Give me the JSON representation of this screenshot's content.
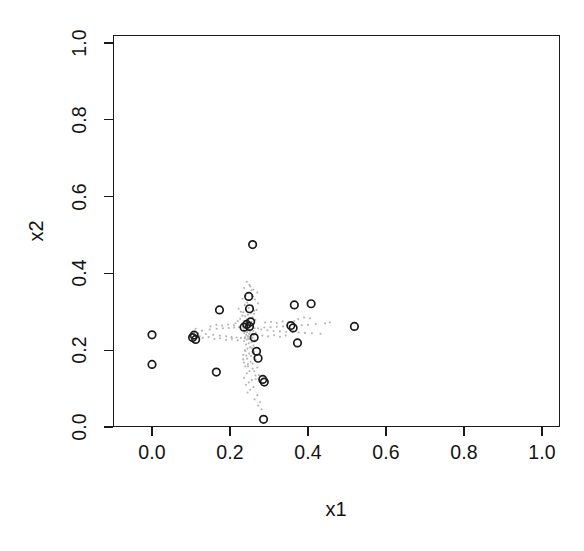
{
  "chart_data": {
    "type": "scatter",
    "title": "",
    "xlabel": "x1",
    "ylabel": "x2",
    "xlim": [
      0,
      1
    ],
    "ylim": [
      0,
      1
    ],
    "xticks": [
      "0.0",
      "0.2",
      "0.4",
      "0.6",
      "0.8",
      "1.0"
    ],
    "xtickvalues": [
      0.0,
      0.2,
      0.4,
      0.6,
      0.8,
      1.0
    ],
    "yticks": [
      "0.0",
      "0.2",
      "0.4",
      "0.6",
      "0.8",
      "1.0"
    ],
    "ytickvalues": [
      0.0,
      0.2,
      0.4,
      0.6,
      0.8,
      1.0
    ],
    "grid": false,
    "legend": null,
    "box": true,
    "series": [
      {
        "name": "background-points",
        "marker": "dot",
        "color": "#b4b4b4",
        "size": 2.1,
        "points": [
          [
            0.243,
            0.378
          ],
          [
            0.25,
            0.37
          ],
          [
            0.236,
            0.362
          ],
          [
            0.255,
            0.356
          ],
          [
            0.246,
            0.349
          ],
          [
            0.24,
            0.342
          ],
          [
            0.259,
            0.34
          ],
          [
            0.232,
            0.334
          ],
          [
            0.251,
            0.33
          ],
          [
            0.244,
            0.324
          ],
          [
            0.238,
            0.318
          ],
          [
            0.257,
            0.316
          ],
          [
            0.248,
            0.31
          ],
          [
            0.241,
            0.305
          ],
          [
            0.262,
            0.303
          ],
          [
            0.234,
            0.299
          ],
          [
            0.253,
            0.296
          ],
          [
            0.246,
            0.292
          ],
          [
            0.239,
            0.288
          ],
          [
            0.258,
            0.286
          ],
          [
            0.25,
            0.283
          ],
          [
            0.243,
            0.28
          ],
          [
            0.265,
            0.279
          ],
          [
            0.236,
            0.276
          ],
          [
            0.255,
            0.274
          ],
          [
            0.248,
            0.272
          ],
          [
            0.241,
            0.27
          ],
          [
            0.26,
            0.269
          ],
          [
            0.252,
            0.267
          ],
          [
            0.245,
            0.265
          ],
          [
            0.238,
            0.263
          ],
          [
            0.257,
            0.262
          ],
          [
            0.25,
            0.26
          ],
          [
            0.243,
            0.258
          ],
          [
            0.263,
            0.257
          ],
          [
            0.235,
            0.256
          ],
          [
            0.254,
            0.254
          ],
          [
            0.247,
            0.252
          ],
          [
            0.24,
            0.251
          ],
          [
            0.259,
            0.25
          ],
          [
            0.251,
            0.248
          ],
          [
            0.244,
            0.247
          ],
          [
            0.266,
            0.246
          ],
          [
            0.237,
            0.245
          ],
          [
            0.256,
            0.243
          ],
          [
            0.249,
            0.242
          ],
          [
            0.242,
            0.24
          ],
          [
            0.261,
            0.239
          ],
          [
            0.253,
            0.237
          ],
          [
            0.246,
            0.236
          ],
          [
            0.239,
            0.234
          ],
          [
            0.258,
            0.232
          ],
          [
            0.25,
            0.23
          ],
          [
            0.243,
            0.228
          ],
          [
            0.264,
            0.226
          ],
          [
            0.236,
            0.224
          ],
          [
            0.255,
            0.221
          ],
          [
            0.248,
            0.218
          ],
          [
            0.241,
            0.215
          ],
          [
            0.26,
            0.212
          ],
          [
            0.252,
            0.208
          ],
          [
            0.245,
            0.204
          ],
          [
            0.238,
            0.2
          ],
          [
            0.257,
            0.196
          ],
          [
            0.249,
            0.191
          ],
          [
            0.242,
            0.186
          ],
          [
            0.262,
            0.181
          ],
          [
            0.234,
            0.176
          ],
          [
            0.253,
            0.17
          ],
          [
            0.246,
            0.164
          ],
          [
            0.239,
            0.158
          ],
          [
            0.258,
            0.152
          ],
          [
            0.25,
            0.146
          ],
          [
            0.243,
            0.14
          ],
          [
            0.265,
            0.134
          ],
          [
            0.236,
            0.128
          ],
          [
            0.256,
            0.122
          ],
          [
            0.248,
            0.116
          ],
          [
            0.241,
            0.11
          ],
          [
            0.26,
            0.104
          ],
          [
            0.252,
            0.097
          ],
          [
            0.245,
            0.09
          ],
          [
            0.27,
            0.083
          ],
          [
            0.263,
            0.072
          ],
          [
            0.277,
            0.065
          ],
          [
            0.272,
            0.056
          ],
          [
            0.281,
            0.046
          ],
          [
            0.108,
            0.247
          ],
          [
            0.118,
            0.244
          ],
          [
            0.128,
            0.251
          ],
          [
            0.138,
            0.242
          ],
          [
            0.148,
            0.254
          ],
          [
            0.157,
            0.24
          ],
          [
            0.166,
            0.256
          ],
          [
            0.174,
            0.238
          ],
          [
            0.182,
            0.257
          ],
          [
            0.19,
            0.236
          ],
          [
            0.197,
            0.258
          ],
          [
            0.204,
            0.234
          ],
          [
            0.211,
            0.259
          ],
          [
            0.217,
            0.233
          ],
          [
            0.223,
            0.26
          ],
          [
            0.228,
            0.232
          ],
          [
            0.233,
            0.261
          ],
          [
            0.238,
            0.231
          ],
          [
            0.242,
            0.262
          ],
          [
            0.247,
            0.23
          ],
          [
            0.13,
            0.232
          ],
          [
            0.145,
            0.234
          ],
          [
            0.16,
            0.229
          ],
          [
            0.175,
            0.231
          ],
          [
            0.19,
            0.227
          ],
          [
            0.205,
            0.229
          ],
          [
            0.22,
            0.226
          ],
          [
            0.15,
            0.262
          ],
          [
            0.165,
            0.266
          ],
          [
            0.18,
            0.264
          ],
          [
            0.195,
            0.267
          ],
          [
            0.21,
            0.265
          ],
          [
            0.272,
            0.257
          ],
          [
            0.28,
            0.254
          ],
          [
            0.288,
            0.259
          ],
          [
            0.296,
            0.252
          ],
          [
            0.304,
            0.26
          ],
          [
            0.312,
            0.25
          ],
          [
            0.32,
            0.261
          ],
          [
            0.328,
            0.249
          ],
          [
            0.336,
            0.262
          ],
          [
            0.344,
            0.248
          ],
          [
            0.352,
            0.263
          ],
          [
            0.36,
            0.247
          ],
          [
            0.368,
            0.264
          ],
          [
            0.376,
            0.246
          ],
          [
            0.384,
            0.265
          ],
          [
            0.392,
            0.245
          ],
          [
            0.4,
            0.266
          ],
          [
            0.41,
            0.244
          ],
          [
            0.42,
            0.268
          ],
          [
            0.432,
            0.243
          ],
          [
            0.444,
            0.27
          ],
          [
            0.456,
            0.272
          ],
          [
            0.29,
            0.272
          ],
          [
            0.305,
            0.274
          ],
          [
            0.32,
            0.271
          ],
          [
            0.335,
            0.275
          ],
          [
            0.35,
            0.273
          ],
          [
            0.365,
            0.276
          ],
          [
            0.283,
            0.238
          ],
          [
            0.298,
            0.236
          ],
          [
            0.313,
            0.239
          ],
          [
            0.328,
            0.235
          ],
          [
            0.343,
            0.238
          ],
          [
            0.262,
            0.295
          ],
          [
            0.268,
            0.305
          ],
          [
            0.258,
            0.313
          ],
          [
            0.272,
            0.322
          ],
          [
            0.264,
            0.332
          ],
          [
            0.256,
            0.341
          ],
          [
            0.27,
            0.35
          ],
          [
            0.26,
            0.358
          ],
          [
            0.252,
            0.366
          ],
          [
            0.232,
            0.29
          ],
          [
            0.226,
            0.282
          ],
          [
            0.22,
            0.276
          ],
          [
            0.214,
            0.27
          ],
          [
            0.228,
            0.3
          ],
          [
            0.222,
            0.308
          ],
          [
            0.256,
            0.205
          ],
          [
            0.262,
            0.195
          ],
          [
            0.254,
            0.185
          ],
          [
            0.266,
            0.175
          ],
          [
            0.258,
            0.165
          ],
          [
            0.27,
            0.155
          ],
          [
            0.262,
            0.145
          ],
          [
            0.274,
            0.135
          ],
          [
            0.266,
            0.125
          ],
          [
            0.278,
            0.115
          ],
          [
            0.24,
            0.198
          ],
          [
            0.234,
            0.188
          ],
          [
            0.244,
            0.178
          ],
          [
            0.236,
            0.168
          ],
          [
            0.246,
            0.158
          ],
          [
            0.1,
            0.238
          ],
          [
            0.112,
            0.256
          ],
          [
            0.122,
            0.236
          ],
          [
            0.375,
            0.281
          ],
          [
            0.39,
            0.285
          ],
          [
            0.405,
            0.283
          ]
        ]
      },
      {
        "name": "highlighted-points",
        "marker": "open-circle",
        "color": "#1a1a1a",
        "size": 7.5,
        "points": [
          [
            0.0,
            0.24
          ],
          [
            0.0,
            0.163
          ],
          [
            0.104,
            0.233
          ],
          [
            0.112,
            0.228
          ],
          [
            0.108,
            0.239
          ],
          [
            0.165,
            0.143
          ],
          [
            0.173,
            0.305
          ],
          [
            0.236,
            0.26
          ],
          [
            0.243,
            0.267
          ],
          [
            0.25,
            0.262
          ],
          [
            0.253,
            0.274
          ],
          [
            0.248,
            0.34
          ],
          [
            0.25,
            0.308
          ],
          [
            0.258,
            0.475
          ],
          [
            0.262,
            0.233
          ],
          [
            0.268,
            0.197
          ],
          [
            0.272,
            0.179
          ],
          [
            0.284,
            0.124
          ],
          [
            0.288,
            0.117
          ],
          [
            0.286,
            0.02
          ],
          [
            0.356,
            0.264
          ],
          [
            0.362,
            0.258
          ],
          [
            0.365,
            0.318
          ],
          [
            0.373,
            0.219
          ],
          [
            0.408,
            0.321
          ],
          [
            0.519,
            0.262
          ]
        ]
      }
    ]
  },
  "axes": {
    "x_label": "x1",
    "y_label": "x2"
  }
}
